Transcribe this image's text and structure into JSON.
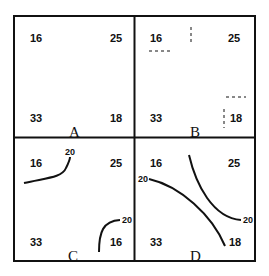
{
  "panels": [
    {
      "id": "A",
      "label": "A",
      "corners": {
        "top_left": "16",
        "top_right": "25",
        "bottom_left": "33",
        "bottom_right": "18"
      },
      "contours": []
    },
    {
      "id": "B",
      "label": "B",
      "corners": {
        "top_left": "16",
        "top_right": "25",
        "bottom_left": "33",
        "bottom_right": "18"
      },
      "contours": [
        "dashed-segments"
      ]
    },
    {
      "id": "C",
      "label": "C",
      "corners": {
        "top_left": "16",
        "top_right": "25",
        "bottom_left": "33",
        "bottom_right": "16"
      },
      "contours": [
        {
          "value": "20"
        },
        {
          "value": "20"
        }
      ]
    },
    {
      "id": "D",
      "label": "D",
      "corners": {
        "top_left": "16",
        "top_right": "25",
        "bottom_left": "33",
        "bottom_right": "18"
      },
      "contours": [
        {
          "value": "20"
        },
        {
          "value": "20"
        }
      ]
    }
  ]
}
